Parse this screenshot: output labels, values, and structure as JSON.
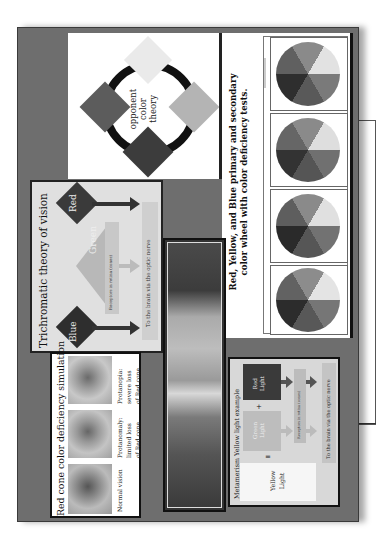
{
  "page": {
    "orientation": "rotated-90-ccw",
    "background": "#ffffff",
    "poster_bg": "#6e6e6e"
  },
  "opponent_panel": {
    "label_lines": [
      "opponent",
      "color",
      "theory"
    ],
    "diamonds": [
      {
        "position": "top",
        "color": "#eaeaea"
      },
      {
        "position": "right",
        "color": "#b4b4b4"
      },
      {
        "position": "bottom",
        "color": "#3c3c3c"
      },
      {
        "position": "left",
        "color": "#5c5c5c"
      }
    ],
    "ring_color": "#111111"
  },
  "color_test_panel": {
    "title_line1": "Red, Yellow, and Blue primary and secondary",
    "title_line2": "color wheel with color deficiency tests.",
    "wheels": [
      {
        "label": "Normal vision"
      },
      {
        "label": "Protanomaly"
      },
      {
        "label": "Deuteranomaly"
      },
      {
        "label": "Tritanomaly"
      }
    ]
  },
  "trichromatic_panel": {
    "title": "Trichromatic theory of vision",
    "cones": [
      {
        "label": "Red",
        "color": "#3a3a3a"
      },
      {
        "label": "Green",
        "color": "#b8b8b8"
      },
      {
        "label": "Blue",
        "color": "#2e2e2e"
      }
    ],
    "receptor_label": "Receptors in retina (cones)",
    "brain_label": "To the brain via the optic nerve"
  },
  "spectrum_bar": {
    "description": "visible spectrum gradient"
  },
  "red_cone_panel": {
    "title": "Red cone color deficiency simulation",
    "images": [
      {
        "caption_lines": [
          "Normal vision"
        ]
      },
      {
        "caption_lines": [
          "Protanomaly:",
          "limited loss",
          "of Red cone"
        ]
      },
      {
        "caption_lines": [
          "Protanopia:",
          "severe loss",
          "of Red cone"
        ]
      }
    ]
  },
  "metamerism_panel": {
    "title": "Metamerism Yellow light example",
    "red_light": [
      "Red",
      "Light"
    ],
    "green_light": [
      "Green",
      "Light"
    ],
    "plus": "+",
    "equals": "=",
    "yellow_light": [
      "Yellow",
      "Light"
    ],
    "receptor_label": "Receptors in retina (cones)",
    "brain_label": "To the brain via the optic nerve"
  }
}
